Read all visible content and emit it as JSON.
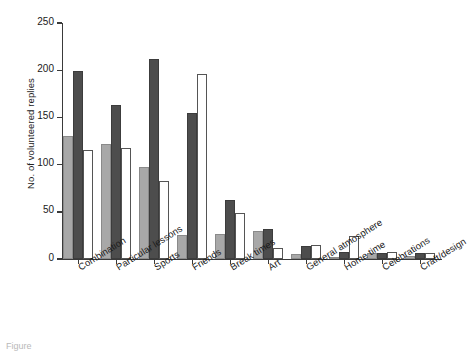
{
  "chart_data": {
    "type": "bar",
    "title": "",
    "xlabel": "",
    "ylabel": "No. of volunteered replies",
    "ylim": [
      0,
      250
    ],
    "yticks": [
      0,
      50,
      100,
      150,
      200,
      250
    ],
    "grid": false,
    "legend": "none",
    "categories": [
      "Combination",
      "Particular lessons",
      "Sports",
      "Friends",
      "Break times",
      "Art",
      "General atmosphere",
      "Home time",
      "Celebrations",
      "Craft/design"
    ],
    "series": [
      {
        "name": "Series 1",
        "color": "#a8a8a8",
        "values": [
          130,
          122,
          98,
          25,
          27,
          30,
          5,
          2,
          6,
          3
        ]
      },
      {
        "name": "Series 2",
        "color": "#4d4d4d",
        "values": [
          199,
          163,
          212,
          155,
          62,
          32,
          14,
          7,
          6,
          6
        ]
      },
      {
        "name": "Series 3",
        "color": "#ffffff",
        "values": [
          115,
          118,
          83,
          196,
          49,
          12,
          15,
          24,
          7,
          6
        ]
      }
    ]
  },
  "caption": {
    "text": "Figure"
  }
}
